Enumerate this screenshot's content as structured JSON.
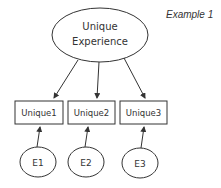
{
  "diagram": {
    "title": "Example 1",
    "latent": {
      "label_line1": "Unique",
      "label_line2": "Experience"
    },
    "indicators": [
      {
        "label": "Unique1"
      },
      {
        "label": "Unique2"
      },
      {
        "label": "Unique3"
      }
    ],
    "errors": [
      {
        "label": "E1"
      },
      {
        "label": "E2"
      },
      {
        "label": "E3"
      }
    ],
    "colors": {
      "stroke": "#333333",
      "background": "#ffffff"
    }
  }
}
